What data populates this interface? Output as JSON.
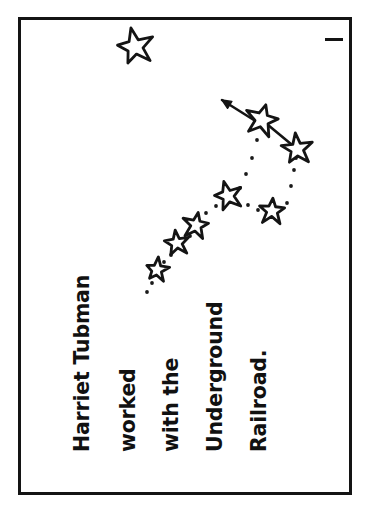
{
  "page": {
    "background_color": "#ffffff",
    "ink_color": "#141414",
    "width": 370,
    "height": 508
  },
  "frame": {
    "name": "page-border",
    "x": 18,
    "y": 17,
    "width": 334,
    "height": 478,
    "stroke_width": 3,
    "color": "#141414"
  },
  "marks": {
    "top_right_dash": {
      "label": "-",
      "x": 325,
      "y": 38,
      "width": 18,
      "height": 3,
      "color": "#141414"
    }
  },
  "caption": {
    "full_text": "Harriet Tubman worked with the Underground Railroad.",
    "orientation": "rotated-90-ccw",
    "font_size": 20.5,
    "color": "#111111",
    "lines": [
      {
        "text": "Harriet Tubman",
        "x": 72,
        "y": 452
      },
      {
        "text": "worked",
        "x": 118,
        "y": 452
      },
      {
        "text": "with the",
        "x": 161,
        "y": 452
      },
      {
        "text": "Underground",
        "x": 205,
        "y": 452
      },
      {
        "text": "Railroad.",
        "x": 249,
        "y": 452
      }
    ]
  },
  "artwork": {
    "type": "constellation-illustration",
    "description": "Big Dipper constellation with dotted trail and arrow pointing to the North Star",
    "north_star": {
      "name": "north-star",
      "cx": 135,
      "cy": 47,
      "radius": 19,
      "rotation": -12
    },
    "arrow": {
      "name": "direction-arrow",
      "from_x": 257,
      "from_y": 122,
      "to_x": 222,
      "to_y": 100,
      "head_size": 10
    },
    "dipper_stars": [
      {
        "id": "dubhe",
        "cx": 262,
        "cy": 120,
        "radius": 17,
        "rotation": 14
      },
      {
        "id": "merak",
        "cx": 297,
        "cy": 149,
        "radius": 16,
        "rotation": -6
      },
      {
        "id": "phecda",
        "cx": 272,
        "cy": 211,
        "radius": 14,
        "rotation": 4
      },
      {
        "id": "megrez",
        "cx": 228,
        "cy": 196,
        "radius": 15,
        "rotation": -16
      },
      {
        "id": "alioth",
        "cx": 196,
        "cy": 225,
        "radius": 14,
        "rotation": 10
      },
      {
        "id": "mizar",
        "cx": 177,
        "cy": 243,
        "radius": 13,
        "rotation": -8
      },
      {
        "id": "alkaid",
        "cx": 157,
        "cy": 270,
        "radius": 12,
        "rotation": 6
      }
    ],
    "solid_links": [
      {
        "from": "dubhe",
        "to": "merak"
      }
    ],
    "dotted_trail": {
      "name": "dotted-path",
      "dot_radius": 1.9,
      "color": "#1a1a1a",
      "points": [
        [
          257,
          140
        ],
        [
          252,
          158
        ],
        [
          246,
          174
        ],
        [
          240,
          188
        ],
        [
          248,
          205
        ],
        [
          258,
          210
        ],
        [
          287,
          203
        ],
        [
          291,
          186
        ],
        [
          294,
          170
        ],
        [
          296,
          158
        ],
        [
          216,
          206
        ],
        [
          206,
          213
        ],
        [
          190,
          236
        ],
        [
          181,
          247
        ],
        [
          171,
          255
        ],
        [
          164,
          262
        ],
        [
          152,
          283
        ],
        [
          147,
          292
        ]
      ]
    }
  }
}
